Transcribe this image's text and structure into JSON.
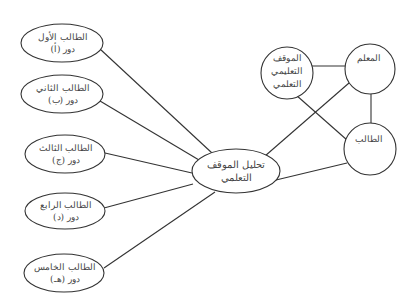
{
  "diagram": {
    "type": "concept-map",
    "colors": {
      "stroke": "#333333",
      "text": "#444444",
      "background": "#ffffff"
    },
    "center_node": {
      "id": "analysis",
      "line1": "تحليل الموقف",
      "line2": "التعلمي",
      "shape": "ellipse"
    },
    "student_nodes": [
      {
        "id": "s1",
        "name": "الطالب الأول",
        "role": "دور (أ)"
      },
      {
        "id": "s2",
        "name": "الطالب الثاني",
        "role": "دور (ب)"
      },
      {
        "id": "s3",
        "name": "الطالب الثالث",
        "role": "دور (ج)"
      },
      {
        "id": "s4",
        "name": "الطالب الرابع",
        "role": "دور (د)"
      },
      {
        "id": "s5",
        "name": "الطالب الخامس",
        "role": "دور (هـ)"
      }
    ],
    "triangle_nodes": {
      "situation": {
        "line1": "الموقف",
        "line2": "التعليمي",
        "line3": "التعلمي"
      },
      "teacher": {
        "label": "المعلم"
      },
      "student": {
        "label": "الطالب"
      }
    },
    "edges": [
      [
        "s1",
        "analysis"
      ],
      [
        "s2",
        "analysis"
      ],
      [
        "s3",
        "analysis"
      ],
      [
        "s4",
        "analysis"
      ],
      [
        "s5",
        "analysis"
      ],
      [
        "teacher",
        "analysis"
      ],
      [
        "student",
        "analysis"
      ],
      [
        "situation",
        "teacher"
      ],
      [
        "situation",
        "student"
      ],
      [
        "teacher",
        "student"
      ]
    ]
  }
}
